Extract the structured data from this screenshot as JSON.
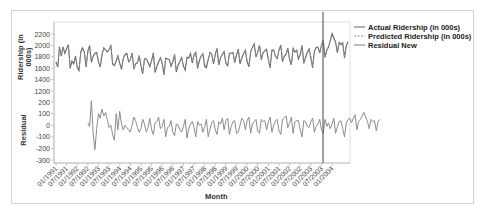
{
  "chart_data": {
    "type": "line",
    "title": "",
    "xlabel": "Month",
    "panels": [
      {
        "ylabel": "Ridership (in 000s)",
        "yticks": [
          1200,
          1400,
          1600,
          1800,
          2000,
          2200
        ],
        "ylim": [
          1200,
          2300
        ],
        "series": [
          {
            "name": "Actual Ridership (in 000s)",
            "style": "solid"
          },
          {
            "name": "Predicted Ridership (in 000s)",
            "style": "dashed"
          }
        ]
      },
      {
        "ylabel": "Residual",
        "yticks": [
          -300,
          -200,
          -100,
          0,
          100,
          200
        ],
        "ylim": [
          -300,
          250
        ],
        "series": [
          {
            "name": "Residual New",
            "style": "solid"
          }
        ]
      }
    ],
    "x_tick_labels": [
      "01/1991",
      "07/1991",
      "01/1992",
      "07/1992",
      "01/1993",
      "07/1993",
      "01/1994",
      "07/1994",
      "01/1995",
      "07/1995",
      "01/1996",
      "07/1996",
      "01/1997",
      "07/1997",
      "01/1998",
      "07/1998",
      "01/1999",
      "07/1999",
      "01/2000",
      "07/2000",
      "01/2001",
      "07/2001",
      "01/2002",
      "07/2002",
      "01/2003",
      "07/2003",
      "01/2004"
    ],
    "reference_line_x": "04/2003",
    "actual": [
      1709,
      1621,
      1973,
      1812,
      1975,
      1862,
      1940,
      2013,
      1596,
      1725,
      1676,
      1814,
      1615,
      1557,
      1891,
      1956,
      1885,
      1623,
      1903,
      1997,
      1704,
      1810,
      1862,
      1875,
      1705,
      1619,
      1837,
      1957,
      1917,
      1882,
      1933,
      1996,
      1673,
      1646,
      1725,
      1820,
      1687,
      1579,
      1767,
      1840,
      1859,
      1712,
      1752,
      1866,
      1582,
      1676,
      1694,
      1823,
      1645,
      1502,
      1764,
      1761,
      1705,
      1627,
      1728,
      1870,
      1524,
      1633,
      1708,
      1781,
      1684,
      1481,
      1775,
      1760,
      1751,
      1633,
      1711,
      1842,
      1534,
      1654,
      1717,
      1786,
      1636,
      1569,
      1791,
      1779,
      1858,
      1695,
      1835,
      1877,
      1596,
      1726,
      1814,
      1851,
      1632,
      1609,
      1749,
      1875,
      1845,
      1675,
      1843,
      1948,
      1658,
      1788,
      1841,
      1892,
      1684,
      1641,
      1858,
      1866,
      1872,
      1697,
      1835,
      1935,
      1675,
      1774,
      1857,
      1914,
      1718,
      1625,
      1893,
      1965,
      2027,
      1793,
      1882,
      2005,
      1747,
      1871,
      1904,
      1932,
      1744,
      1606,
      1919,
      1917,
      1812,
      1770,
      1918,
      2007,
      1715,
      1807,
      1842,
      1953,
      1753,
      1662,
      1947,
      1882,
      1915,
      1763,
      1833,
      2000,
      1684,
      1784,
      1877,
      1939,
      1784,
      1611,
      1897,
      1963,
      1973,
      1864,
      2006,
      2088,
      1789,
      1913,
      1975,
      2088,
      2203,
      2130,
      2063,
      1868,
      2054,
      2017,
      2044,
      1783,
      1982,
      2066
    ],
    "predicted": [
      1690,
      1640,
      1950,
      1830,
      1960,
      1880,
      1920,
      1990,
      1620,
      1740,
      1700,
      1800,
      1640,
      1580,
      1870,
      1930,
      1880,
      1650,
      1880,
      1970,
      1730,
      1800,
      1850,
      1870,
      1720,
      1640,
      1830,
      1940,
      1910,
      1880,
      1920,
      1980,
      1700,
      1660,
      1740,
      1810,
      1700,
      1600,
      1760,
      1830,
      1850,
      1720,
      1760,
      1860,
      1600,
      1690,
      1710,
      1820,
      1660,
      1530,
      1760,
      1770,
      1710,
      1650,
      1730,
      1860,
      1550,
      1650,
      1720,
      1780,
      1690,
      1510,
      1770,
      1760,
      1750,
      1650,
      1720,
      1830,
      1560,
      1670,
      1720,
      1790,
      1650,
      1590,
      1780,
      1780,
      1850,
      1710,
      1830,
      1870,
      1620,
      1740,
      1810,
      1850,
      1650,
      1630,
      1750,
      1870,
      1840,
      1690,
      1840,
      1940,
      1680,
      1800,
      1840,
      1890,
      1700,
      1660,
      1850,
      1860,
      1870,
      1710,
      1840,
      1930,
      1700,
      1790,
      1860,
      1910,
      1730,
      1650,
      1890,
      1960,
      2010,
      1810,
      1880,
      2000,
      1770,
      1880,
      1900,
      1930,
      1760,
      1630,
      1910,
      1920,
      1820,
      1780,
      1920,
      2000,
      1740,
      1820,
      1850,
      1950,
      1770,
      1680,
      1940,
      1890,
      1920,
      1780,
      1840,
      1990,
      1710,
      1800,
      1880,
      1940,
      1800,
      1640,
      1890,
      1960,
      1970,
      1870,
      2000,
      2080,
      1810,
      1920,
      1980,
      2080,
      2170,
      2110,
      2050,
      1880,
      2050,
      2010,
      2040,
      1800,
      1980,
      2060
    ],
    "residual_start_index": 18,
    "residual": [
      20,
      -10,
      210,
      -70,
      -210,
      -30,
      100,
      60,
      140,
      80,
      110,
      50,
      -20,
      0,
      -80,
      -130,
      100,
      -40,
      120,
      10,
      -40,
      0,
      -20,
      -40,
      -60,
      0,
      70,
      40,
      -20,
      -60,
      -30,
      50,
      10,
      -60,
      -20,
      60,
      -40,
      -80,
      20,
      30,
      70,
      -30,
      -10,
      50,
      -100,
      -20,
      -10,
      40,
      -60,
      -90,
      10,
      0,
      -40,
      -60,
      -10,
      50,
      -110,
      -30,
      10,
      30,
      -20,
      -100,
      30,
      0,
      10,
      -60,
      -10,
      50,
      -100,
      -30,
      20,
      40,
      -40,
      -80,
      30,
      10,
      60,
      -40,
      40,
      60,
      -80,
      -10,
      30,
      40,
      -70,
      -60,
      0,
      60,
      40,
      -40,
      40,
      70,
      -70,
      10,
      30,
      50,
      -50,
      -70,
      50,
      30,
      40,
      -40,
      30,
      70,
      -60,
      0,
      40,
      50,
      -50,
      -80,
      50,
      60,
      80,
      -20,
      20,
      70,
      -70,
      30,
      40,
      40,
      -40,
      -100,
      40,
      30,
      -10,
      -20,
      30,
      60,
      -60,
      -10,
      10,
      50,
      -40,
      -70,
      50,
      -10,
      20,
      -30,
      10,
      60,
      -70,
      -10,
      30,
      40,
      -30,
      -100,
      20,
      50,
      60,
      20,
      60,
      90,
      -40,
      30,
      50,
      80,
      110,
      70,
      30,
      -30,
      50,
      30,
      40,
      -50,
      30,
      50
    ]
  },
  "legend": {
    "items": [
      {
        "label": "Actual Ridership (in 000s)",
        "style": "solid",
        "color": "#6e6e6e"
      },
      {
        "label": "Predicted Ridership (in 000s)",
        "style": "dashed",
        "color": "#8a8a8a"
      },
      {
        "label": "Residual New",
        "style": "solid",
        "color": "#8a8a8a"
      }
    ]
  },
  "colors": {
    "actual": "#5f5f5f",
    "predicted": "#9a9a9a",
    "residual": "#8c8c8c",
    "reference_line": "#444444",
    "axis": "#b5b5b5"
  },
  "axes": {
    "top_ylabel_line1": "Ridership (in",
    "top_ylabel_line2": "000s)",
    "bottom_ylabel": "Residual",
    "xlabel": "Month"
  }
}
